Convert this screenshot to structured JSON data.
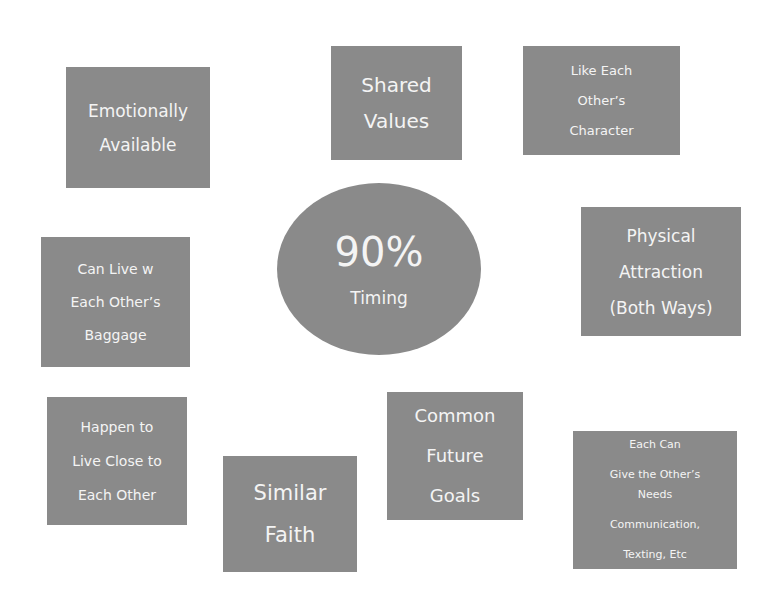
{
  "colors": {
    "node_fill": "#8a8a8a",
    "text": "#f4f4f4",
    "background": "#ffffff"
  },
  "center": {
    "value": "90%",
    "label": "Timing"
  },
  "nodes": [
    {
      "id": "emotionally-available",
      "lines": [
        "Emotionally",
        "Available"
      ]
    },
    {
      "id": "shared-values",
      "lines": [
        "Shared",
        "Values"
      ]
    },
    {
      "id": "like-each-others-character",
      "lines": [
        "Like Each",
        "Other’s",
        "Character"
      ]
    },
    {
      "id": "can-live-with-baggage",
      "lines": [
        "Can Live w",
        "Each Other’s",
        "Baggage"
      ]
    },
    {
      "id": "physical-attraction",
      "lines": [
        "Physical",
        "Attraction",
        "(Both Ways)"
      ]
    },
    {
      "id": "live-close",
      "lines": [
        "Happen to",
        "Live Close to",
        "Each Other"
      ]
    },
    {
      "id": "similar-faith",
      "lines": [
        "Similar",
        "Faith"
      ]
    },
    {
      "id": "common-future-goals",
      "lines": [
        "Common",
        "Future",
        "Goals"
      ]
    },
    {
      "id": "each-can-give-needs",
      "lines": [
        "Each Can",
        "Give the Other’s",
        "Needs",
        "Communication,",
        "Texting, Etc"
      ]
    }
  ]
}
